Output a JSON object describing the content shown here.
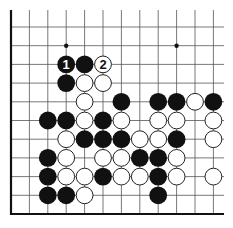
{
  "board": {
    "title": "Go problem diagram",
    "columns": 12,
    "rows": 11,
    "origin_x": 11,
    "origin_y": 27,
    "step_x": 18.4,
    "step_y": 18.7,
    "right_extent_x": 224,
    "top_extent_y": 10,
    "line_color": "#555555",
    "border_color": "#111111",
    "black_color": "#111111",
    "white_fill": "#ffffff",
    "white_stroke": "#222222",
    "star_points": [
      {
        "col": 3,
        "row": 1
      },
      {
        "col": 9,
        "row": 1
      }
    ],
    "stones": [
      {
        "col": 3,
        "row": 2,
        "color": "black",
        "label": "1"
      },
      {
        "col": 4,
        "row": 2,
        "color": "black"
      },
      {
        "col": 5,
        "row": 2,
        "color": "white",
        "label": "2"
      },
      {
        "col": 3,
        "row": 3,
        "color": "black"
      },
      {
        "col": 4,
        "row": 3,
        "color": "white"
      },
      {
        "col": 5,
        "row": 3,
        "color": "white"
      },
      {
        "col": 4,
        "row": 4,
        "color": "white"
      },
      {
        "col": 6,
        "row": 4,
        "color": "black"
      },
      {
        "col": 8,
        "row": 4,
        "color": "black"
      },
      {
        "col": 9,
        "row": 4,
        "color": "black"
      },
      {
        "col": 10,
        "row": 4,
        "color": "white"
      },
      {
        "col": 11,
        "row": 4,
        "color": "black"
      },
      {
        "col": 2,
        "row": 5,
        "color": "black"
      },
      {
        "col": 3,
        "row": 5,
        "color": "black"
      },
      {
        "col": 4,
        "row": 5,
        "color": "white"
      },
      {
        "col": 5,
        "row": 5,
        "color": "black"
      },
      {
        "col": 6,
        "row": 5,
        "color": "white"
      },
      {
        "col": 8,
        "row": 5,
        "color": "white"
      },
      {
        "col": 9,
        "row": 5,
        "color": "white"
      },
      {
        "col": 11,
        "row": 5,
        "color": "white"
      },
      {
        "col": 3,
        "row": 6,
        "color": "white"
      },
      {
        "col": 4,
        "row": 6,
        "color": "black"
      },
      {
        "col": 5,
        "row": 6,
        "color": "black"
      },
      {
        "col": 6,
        "row": 6,
        "color": "black"
      },
      {
        "col": 7,
        "row": 6,
        "color": "white"
      },
      {
        "col": 8,
        "row": 6,
        "color": "white"
      },
      {
        "col": 9,
        "row": 6,
        "color": "black"
      },
      {
        "col": 11,
        "row": 6,
        "color": "white"
      },
      {
        "col": 2,
        "row": 7,
        "color": "black"
      },
      {
        "col": 3,
        "row": 7,
        "color": "white"
      },
      {
        "col": 5,
        "row": 7,
        "color": "white"
      },
      {
        "col": 6,
        "row": 7,
        "color": "white"
      },
      {
        "col": 7,
        "row": 7,
        "color": "black"
      },
      {
        "col": 8,
        "row": 7,
        "color": "black"
      },
      {
        "col": 9,
        "row": 7,
        "color": "white"
      },
      {
        "col": 2,
        "row": 8,
        "color": "black"
      },
      {
        "col": 3,
        "row": 8,
        "color": "white"
      },
      {
        "col": 4,
        "row": 8,
        "color": "white"
      },
      {
        "col": 5,
        "row": 8,
        "color": "black"
      },
      {
        "col": 6,
        "row": 8,
        "color": "white"
      },
      {
        "col": 7,
        "row": 8,
        "color": "white"
      },
      {
        "col": 8,
        "row": 8,
        "color": "black"
      },
      {
        "col": 9,
        "row": 8,
        "color": "white"
      },
      {
        "col": 11,
        "row": 8,
        "color": "white"
      },
      {
        "col": 2,
        "row": 9,
        "color": "black"
      },
      {
        "col": 3,
        "row": 9,
        "color": "black"
      },
      {
        "col": 4,
        "row": 9,
        "color": "white"
      },
      {
        "col": 8,
        "row": 9,
        "color": "black"
      }
    ]
  }
}
